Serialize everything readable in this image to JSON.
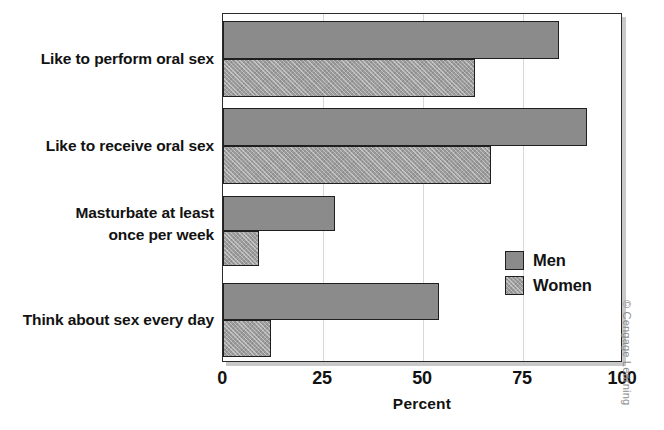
{
  "chart_data": {
    "type": "bar",
    "orientation": "horizontal",
    "title": "",
    "xlabel": "Percent",
    "ylabel": "",
    "xlim": [
      0,
      100
    ],
    "xticks": [
      0,
      25,
      50,
      75,
      100
    ],
    "xtick_labels": [
      "0",
      "25",
      "50",
      "75",
      "100"
    ],
    "grid": true,
    "grid_axis": "x",
    "legend": [
      "Men",
      "Women"
    ],
    "legend_position": "inside-right-lower",
    "categories": [
      "Like to perform oral sex",
      "Like to receive oral sex",
      "Masturbate at least\nonce per week",
      "Think about sex every day"
    ],
    "series": [
      {
        "name": "Men",
        "values": [
          84,
          91,
          28,
          54
        ]
      },
      {
        "name": "Women",
        "values": [
          63,
          67,
          9,
          12
        ]
      }
    ],
    "colors": {
      "men": "#8b8b8b",
      "women": "#9d9d9d",
      "bar_outline": "#1f1f1f",
      "frame": "#2b2b2b",
      "gridline": "#d7d7d7",
      "text": "#121212",
      "background": "#ffffff"
    }
  },
  "axis": {
    "x_title": "Percent",
    "ticks": [
      {
        "label": "0",
        "value": 0
      },
      {
        "label": "25",
        "value": 25
      },
      {
        "label": "50",
        "value": 50
      },
      {
        "label": "75",
        "value": 75
      },
      {
        "label": "100",
        "value": 100
      }
    ]
  },
  "categories": [
    {
      "line1": "Like to perform oral sex",
      "line2": ""
    },
    {
      "line1": "Like to receive oral sex",
      "line2": ""
    },
    {
      "line1": "Masturbate at least",
      "line2": "once per week"
    },
    {
      "line1": "Think about sex every day",
      "line2": ""
    }
  ],
  "legend": {
    "men_label": "Men",
    "women_label": "Women"
  },
  "credit": {
    "text": "© Cengage Learning"
  }
}
